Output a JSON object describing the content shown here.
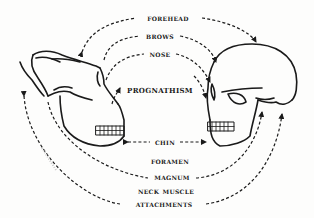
{
  "diagram": {
    "type": "comparison-line-drawing",
    "left_subject": {
      "name": "ape-skull"
    },
    "right_subject": {
      "name": "human-skull"
    },
    "labels": [
      {
        "id": "forehead",
        "text": "Forehead"
      },
      {
        "id": "brows",
        "text": "Brows"
      },
      {
        "id": "nose",
        "text": "Nose"
      },
      {
        "id": "prognathism",
        "text": "Prognathism"
      },
      {
        "id": "chin",
        "text": "Chin"
      },
      {
        "id": "foramen",
        "text": "Foramen"
      },
      {
        "id": "magnum",
        "text": "Magnum"
      },
      {
        "id": "neck_muscle",
        "text": "Neck Muscle"
      },
      {
        "id": "attachments",
        "text": "Attachments"
      }
    ],
    "connector_style": "dashed-arrow",
    "colors": {
      "ink": "#1a1a1a",
      "background": "#fdfdfc"
    }
  }
}
